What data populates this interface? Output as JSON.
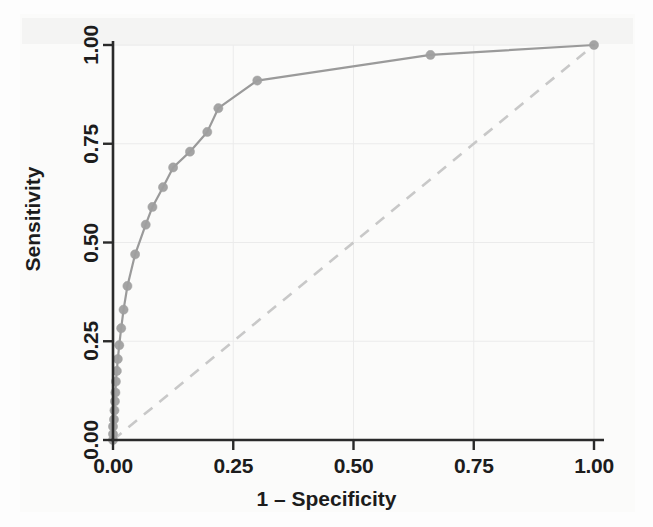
{
  "chart_data": {
    "type": "line",
    "title": "",
    "subtitle": "",
    "xlabel": "1 – Specificity",
    "ylabel": "Sensitivity",
    "xlim": [
      0.0,
      1.0
    ],
    "ylim": [
      0.0,
      1.0
    ],
    "xticks": [
      0.0,
      0.25,
      0.5,
      0.75,
      1.0
    ],
    "yticks": [
      0.0,
      0.25,
      0.5,
      0.75,
      1.0
    ],
    "xticklabels": [
      "0.00",
      "0.25",
      "0.50",
      "0.75",
      "1.00"
    ],
    "yticklabels": [
      "0.00",
      "0.25",
      "0.50",
      "0.75",
      "1.00"
    ],
    "grid": true,
    "grid_color": "#e8e8e8",
    "legend": false,
    "legend_position": "none",
    "series": [
      {
        "name": "ROC curve",
        "style": "solid-with-markers",
        "color": "#9a9a9a",
        "marker": "circle",
        "x": [
          0.0,
          0.0,
          0.0,
          0.002,
          0.003,
          0.004,
          0.005,
          0.006,
          0.008,
          0.01,
          0.013,
          0.017,
          0.022,
          0.03,
          0.046,
          0.068,
          0.082,
          0.104,
          0.125,
          0.16,
          0.196,
          0.219,
          0.3,
          0.66,
          1.0
        ],
        "y": [
          0.0,
          0.015,
          0.034,
          0.052,
          0.075,
          0.098,
          0.12,
          0.148,
          0.175,
          0.205,
          0.24,
          0.283,
          0.33,
          0.39,
          0.47,
          0.545,
          0.59,
          0.64,
          0.69,
          0.73,
          0.78,
          0.84,
          0.91,
          0.975,
          1.0
        ]
      },
      {
        "name": "Reference diagonal",
        "style": "dashed",
        "color": "#c8c8c8",
        "marker": "none",
        "x": [
          0.0,
          1.0
        ],
        "y": [
          0.0,
          1.0
        ]
      }
    ]
  },
  "axes": {
    "x_title": "1 – Specificity",
    "y_title": "Sensitivity",
    "x_ticks": [
      "0.00",
      "0.25",
      "0.50",
      "0.75",
      "1.00"
    ],
    "y_ticks": [
      "0.00",
      "0.25",
      "0.50",
      "0.75",
      "1.00"
    ]
  },
  "colors": {
    "curve": "#9a9a9a",
    "marker": "#a0a0a0",
    "diagonal": "#c8c8c8",
    "axis": "#2a2a2a",
    "grid": "#ebebeb",
    "text": "#1c1c1c",
    "background": "#fdfdfd"
  }
}
